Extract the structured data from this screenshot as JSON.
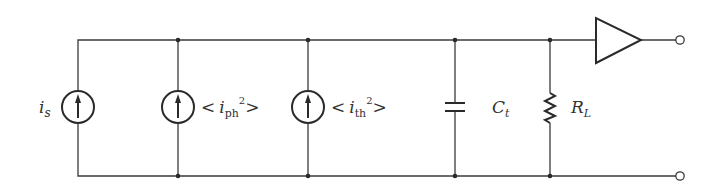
{
  "diagram": {
    "type": "circuit-equivalent-noise-model",
    "nodes": {
      "top_rail_y": 40,
      "bottom_rail_y": 176
    },
    "components": [
      {
        "id": "is",
        "kind": "current-source",
        "x": 78,
        "label": "i",
        "label_sub": "s"
      },
      {
        "id": "iph",
        "kind": "current-source",
        "x": 178,
        "label": "< i",
        "label_sub": "ph",
        "label_sup": "2",
        "label_close": ">"
      },
      {
        "id": "ith",
        "kind": "current-source",
        "x": 308,
        "label": "< i",
        "label_sub": "th",
        "label_sup": "2",
        "label_close": ">"
      },
      {
        "id": "ct",
        "kind": "capacitor",
        "x": 455,
        "label": "C",
        "label_sub": "t"
      },
      {
        "id": "rl",
        "kind": "resistor",
        "x": 550,
        "label": "R",
        "label_sub": "L"
      },
      {
        "id": "amp",
        "kind": "amplifier",
        "x": 596
      },
      {
        "id": "out_top",
        "kind": "terminal",
        "x": 680
      },
      {
        "id": "out_bottom",
        "kind": "terminal",
        "x": 680
      }
    ]
  },
  "labels": {
    "is_main": "i",
    "is_sub": "s",
    "iph_open": "<",
    "iph_main": "i",
    "iph_sub": "ph",
    "iph_sup": "2",
    "iph_close": ">",
    "ith_open": "<",
    "ith_main": "i",
    "ith_sub": "th",
    "ith_sup": "2",
    "ith_close": ">",
    "ct_main": "C",
    "ct_sub": "t",
    "rl_main": "R",
    "rl_sub": "L"
  },
  "colors": {
    "line": "#2a2a2a",
    "background": "#ffffff"
  }
}
